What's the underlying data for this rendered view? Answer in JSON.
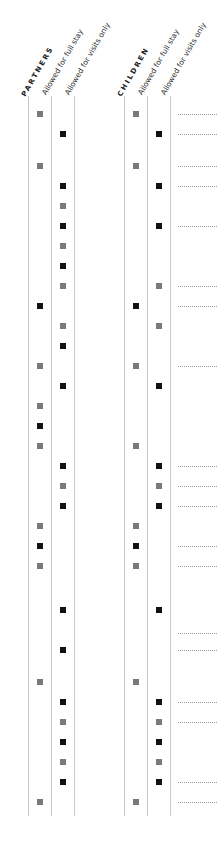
{
  "groups": [
    {
      "key": "partners",
      "label": "PARTNERS",
      "columns": [
        "Allowed for full stay",
        "Allowed for visits only"
      ]
    },
    {
      "key": "children",
      "label": "CHILDREN",
      "columns": [
        "Allowed for full stay",
        "Allowed for visits only"
      ]
    }
  ],
  "legend_colors": {
    "full_stay": "#7a7a7a",
    "visits_only": "#111111"
  },
  "rows": [
    {
      "y": 114,
      "partners": "full",
      "children": "full",
      "dots": true
    },
    {
      "y": 134,
      "partners": "visits",
      "children": "visits",
      "dots": true
    },
    {
      "y": 166,
      "partners": "full",
      "children": "full",
      "dots": true
    },
    {
      "y": 186,
      "partners": "visits",
      "children": "visits",
      "dots": true
    },
    {
      "y": 206,
      "partners": "visits-gray",
      "children": null,
      "dots": false
    },
    {
      "y": 226,
      "partners": "visits",
      "children": "visits",
      "dots": true
    },
    {
      "y": 246,
      "partners": "visits-gray",
      "children": null,
      "dots": false
    },
    {
      "y": 266,
      "partners": "visits",
      "children": null,
      "dots": false
    },
    {
      "y": 286,
      "partners": "visits-gray",
      "children": "visits-gray",
      "dots": true
    },
    {
      "y": 306,
      "partners": "full-black",
      "children": "full-black",
      "dots": true
    },
    {
      "y": 326,
      "partners": "visits-gray",
      "children": "visits-gray",
      "dots": false
    },
    {
      "y": 346,
      "partners": "visits",
      "children": null,
      "dots": false
    },
    {
      "y": 366,
      "partners": "full",
      "children": "full",
      "dots": true
    },
    {
      "y": 386,
      "partners": "visits",
      "children": "visits",
      "dots": false
    },
    {
      "y": 406,
      "partners": "full",
      "children": null,
      "dots": false
    },
    {
      "y": 426,
      "partners": "full-black",
      "children": null,
      "dots": false
    },
    {
      "y": 446,
      "partners": "full",
      "children": "full",
      "dots": false
    },
    {
      "y": 466,
      "partners": "visits",
      "children": "visits",
      "dots": true
    },
    {
      "y": 486,
      "partners": "visits-gray",
      "children": "visits-gray",
      "dots": true
    },
    {
      "y": 506,
      "partners": "visits",
      "children": "visits",
      "dots": true
    },
    {
      "y": 526,
      "partners": "full",
      "children": "full",
      "dots": false
    },
    {
      "y": 546,
      "partners": "full-black",
      "children": "full-black",
      "dots": true
    },
    {
      "y": 566,
      "partners": "full",
      "children": "full",
      "dots": true
    },
    {
      "y": 610,
      "partners": "visits",
      "children": "visits",
      "dots": false
    },
    {
      "y": 633,
      "partners": null,
      "children": null,
      "dots": true
    },
    {
      "y": 650,
      "partners": "visits",
      "children": null,
      "dots": true
    },
    {
      "y": 682,
      "partners": "full",
      "children": "full",
      "dots": false
    },
    {
      "y": 702,
      "partners": "visits",
      "children": "visits",
      "dots": true
    },
    {
      "y": 722,
      "partners": "visits-gray",
      "children": "visits-gray",
      "dots": true
    },
    {
      "y": 742,
      "partners": "visits",
      "children": "visits",
      "dots": false
    },
    {
      "y": 762,
      "partners": "visits-gray",
      "children": "visits-gray",
      "dots": false
    },
    {
      "y": 782,
      "partners": "visits",
      "children": "visits",
      "dots": true
    },
    {
      "y": 802,
      "partners": "full",
      "children": "full",
      "dots": true
    }
  ]
}
